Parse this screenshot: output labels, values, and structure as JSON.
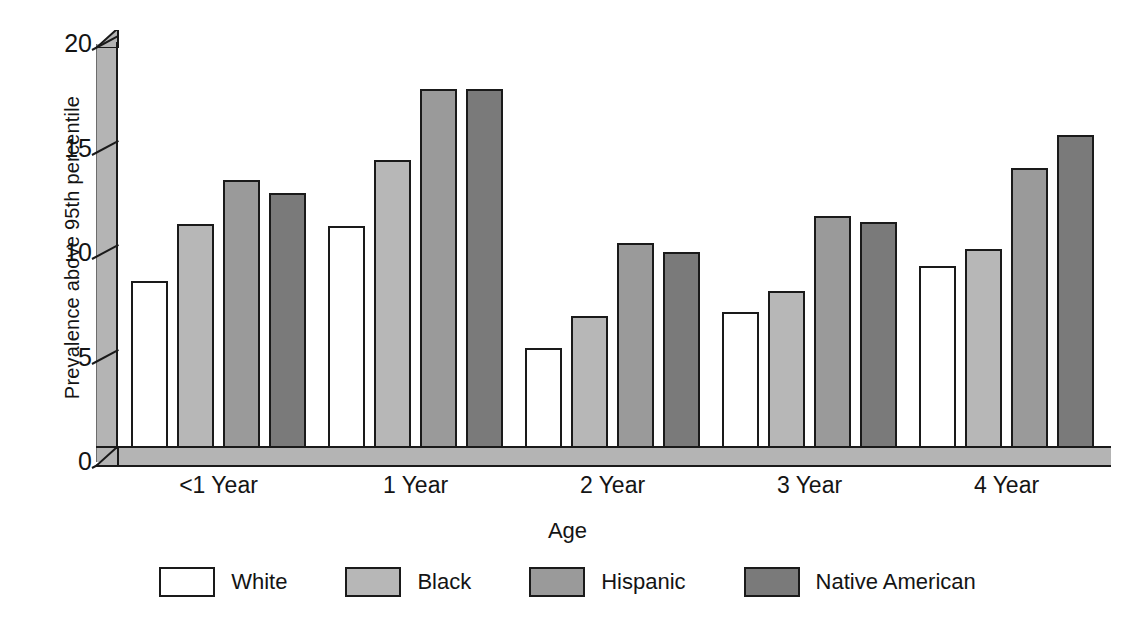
{
  "chart_data": {
    "type": "bar",
    "title": "",
    "xlabel": "Age",
    "ylabel": "Prevalence above 95th percentile",
    "categories": [
      "<1 Year",
      "1 Year",
      "2 Year",
      "3 Year",
      "4 Year"
    ],
    "series": [
      {
        "name": "White",
        "style": "white",
        "color": "#ffffff",
        "values": [
          8.0,
          10.6,
          4.8,
          6.5,
          8.7
        ]
      },
      {
        "name": "Black",
        "style": "light",
        "color": "#b7b7b7",
        "values": [
          10.7,
          13.8,
          6.3,
          7.5,
          9.5
        ]
      },
      {
        "name": "Hispanic",
        "style": "medium",
        "color": "#9a9a9a",
        "values": [
          12.8,
          17.2,
          9.8,
          11.1,
          13.4
        ]
      },
      {
        "name": "Native American",
        "style": "dark",
        "color": "#7a7a7a",
        "values": [
          12.2,
          17.2,
          9.4,
          10.8,
          15.0
        ]
      }
    ],
    "yticks": [
      0,
      5,
      10,
      15,
      20
    ],
    "ylim": [
      0,
      20
    ],
    "grid": false,
    "legend_position": "bottom",
    "axis_style": "3d-slab"
  },
  "axis": {
    "y_title": "Prevalence above 95th percentile",
    "x_title": "Age",
    "y_tick_labels": [
      "20",
      "15",
      "10",
      "5",
      "0"
    ]
  },
  "legend": {
    "items": [
      {
        "label": "White"
      },
      {
        "label": "Black"
      },
      {
        "label": "Hispanic"
      },
      {
        "label": "Native American"
      }
    ]
  }
}
